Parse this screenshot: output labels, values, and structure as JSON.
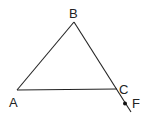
{
  "diagram": {
    "type": "geometry",
    "points": {
      "A": {
        "label": "A",
        "x": 17,
        "y": 90
      },
      "B": {
        "label": "B",
        "x": 74,
        "y": 22
      },
      "C": {
        "label": "C",
        "x": 117,
        "y": 89
      },
      "F": {
        "label": "F",
        "x": 125,
        "y": 104
      }
    },
    "segments": [
      {
        "from": "A",
        "to": "B"
      },
      {
        "from": "B",
        "to": "C"
      },
      {
        "from": "A",
        "to": "C"
      },
      {
        "from": "C",
        "to": "F",
        "note": "extension of BC beyond C"
      }
    ],
    "line_color": "#222222",
    "background": "#ffffff"
  }
}
